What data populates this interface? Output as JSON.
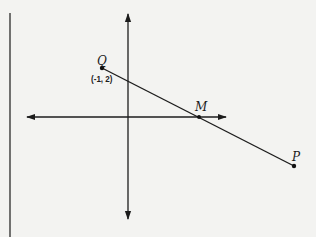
{
  "diagram": {
    "type": "coordinate-plane-segment",
    "colors": {
      "background": "#f3f3f1",
      "ink": "#1c1c1c"
    },
    "frame_line": {
      "x": 10,
      "y1": 13,
      "y2": 237
    },
    "axes": {
      "origin_px": [
        128,
        117
      ],
      "x_axis": {
        "left_tip": [
          26,
          117
        ],
        "right_tip": [
          227,
          117
        ]
      },
      "y_axis": {
        "top_tip": [
          128,
          13
        ],
        "bottom_tip": [
          128,
          220
        ]
      }
    },
    "points": [
      {
        "name": "Q",
        "label": "Q",
        "coord_label": "(-1, 2)",
        "px": [
          102,
          68
        ]
      },
      {
        "name": "M",
        "label": "M",
        "coord_label": "",
        "px": [
          199,
          117
        ]
      },
      {
        "name": "P",
        "label": "P",
        "coord_label": "",
        "px": [
          294,
          166
        ]
      }
    ],
    "segment": {
      "from": "Q",
      "to": "P",
      "passes_through": "M"
    }
  },
  "labels": {
    "q_name": "Q",
    "q_coord": "(-1, 2)",
    "m_name": "M",
    "p_name": "P"
  }
}
